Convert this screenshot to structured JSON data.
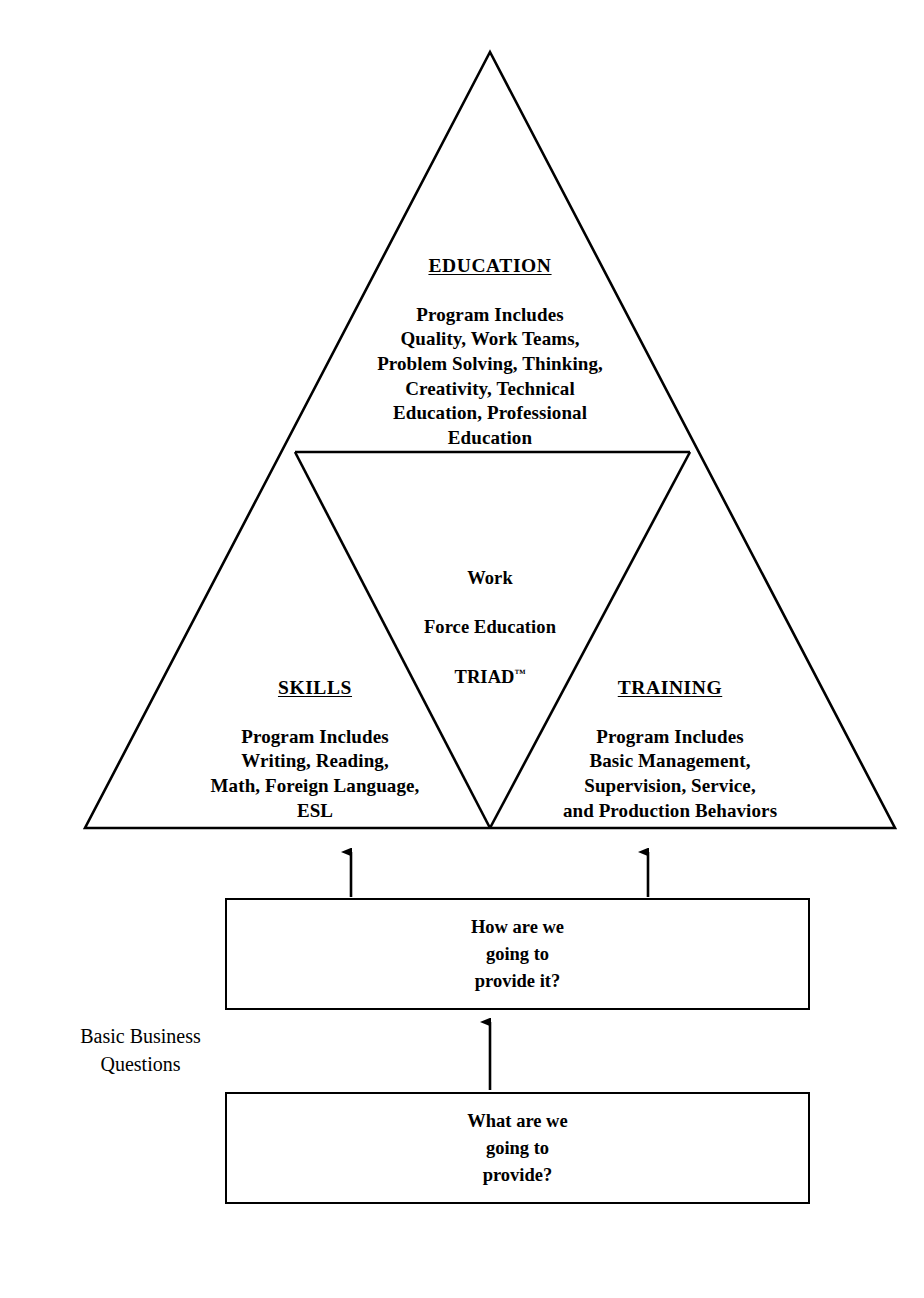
{
  "diagram": {
    "title": "Work Force Education TRIAD",
    "pyramid": {
      "top": {
        "heading": "EDUCATION",
        "body": "Program Includes\nQuality, Work Teams,\nProblem Solving, Thinking,\nCreativity, Technical\nEducation, Professional\nEducation"
      },
      "center": {
        "line1": "Work",
        "line2": "Force Education",
        "line3": "TRIAD",
        "trademark": "™"
      },
      "left": {
        "heading": "SKILLS",
        "body": "Program Includes\nWriting, Reading,\nMath, Foreign Language,\nESL"
      },
      "right": {
        "heading": "TRAINING",
        "body": "Program Includes\nBasic Management,\nSupervision, Service,\nand Production Behaviors"
      }
    },
    "questions": {
      "side_label": "Basic Business\nQuestions",
      "how_box": "How are we\ngoing to\nprovide it?",
      "what_box": "What are we\ngoing to\nprovide?"
    },
    "colors": {
      "stroke": "#000000",
      "background": "#ffffff",
      "text": "#000000"
    }
  }
}
